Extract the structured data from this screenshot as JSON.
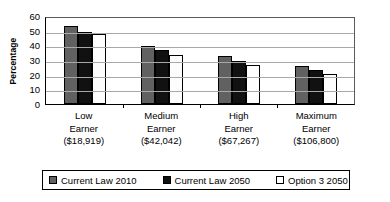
{
  "chart_data": {
    "type": "bar",
    "title": "",
    "xlabel": "",
    "ylabel": "Percentage",
    "ylim": [
      0,
      60
    ],
    "yticks": [
      60,
      50,
      40,
      30,
      20,
      10,
      0
    ],
    "grid": true,
    "legend_position": "bottom",
    "categories": [
      "Low Earner ($18,919)",
      "Medium Earner ($42,042)",
      "High Earner ($67,267)",
      "Maximum Earner ($106,800)"
    ],
    "category_lines": [
      [
        "Low",
        "Earner",
        "($18,919)"
      ],
      [
        "Medium",
        "Earner",
        "($42,042)"
      ],
      [
        "High",
        "Earner",
        "($67,267)"
      ],
      [
        "Maximum",
        "Earner",
        "($106,800)"
      ]
    ],
    "series": [
      {
        "name": "Current Law 2010",
        "color": "#616161",
        "values": [
          53,
          39.5,
          32.5,
          26
        ]
      },
      {
        "name": "Current Law 2050",
        "color": "#111111",
        "values": [
          49,
          36.5,
          29.5,
          23.5
        ]
      },
      {
        "name": "Option 3 2050",
        "color": "#ffffff",
        "values": [
          48,
          33.5,
          26.5,
          20.5
        ]
      }
    ]
  },
  "legend": {
    "items": [
      {
        "label": "Current Law 2010"
      },
      {
        "label": "Current Law 2050"
      },
      {
        "label": "Option 3 2050"
      }
    ]
  }
}
